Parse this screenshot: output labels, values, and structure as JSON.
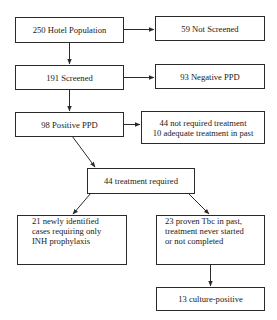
{
  "flowchart": {
    "nodes": {
      "hotel_population": {
        "label": "250 Hotel Population"
      },
      "not_screened": {
        "label": "59 Not Screened"
      },
      "screened": {
        "label": "191 Screened"
      },
      "negative_ppd": {
        "label": "93 Negative PPD"
      },
      "positive_ppd": {
        "label": "98 Positive PPD"
      },
      "not_required": {
        "lines": [
          "44 not required treatment",
          "10 adequate treatment in past"
        ]
      },
      "treatment_required": {
        "label": "44 treatment required"
      },
      "newly_identified": {
        "lines": [
          "21 newly identified",
          "cases requiring only",
          "INH prophylaxis"
        ]
      },
      "proven_tbc": {
        "lines": [
          "23 proven Tbc in past,",
          "treatment never started",
          "or not completed"
        ]
      },
      "culture_positive": {
        "label": "13 culture-positive"
      }
    },
    "edges": [
      {
        "from": "hotel_population",
        "to": "not_screened"
      },
      {
        "from": "hotel_population",
        "to": "screened"
      },
      {
        "from": "screened",
        "to": "negative_ppd"
      },
      {
        "from": "screened",
        "to": "positive_ppd"
      },
      {
        "from": "positive_ppd",
        "to": "not_required"
      },
      {
        "from": "positive_ppd",
        "to": "treatment_required"
      },
      {
        "from": "treatment_required",
        "to": "newly_identified"
      },
      {
        "from": "treatment_required",
        "to": "proven_tbc"
      },
      {
        "from": "proven_tbc",
        "to": "culture_positive"
      }
    ],
    "colors": {
      "line": "#2a2a2a",
      "background": "#ffffff"
    }
  }
}
